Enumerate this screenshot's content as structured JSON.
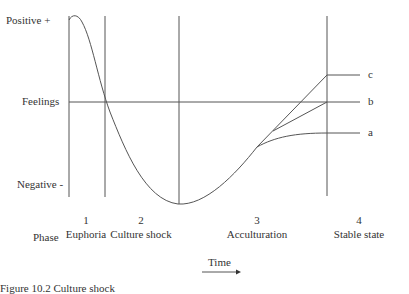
{
  "diagram": {
    "y_axis": {
      "top_label": "Positive +",
      "middle_label": "Feelings",
      "bottom_label": "Negative -"
    },
    "phase_label": "Phase",
    "phases": [
      {
        "number": "1",
        "name": "Euphoria"
      },
      {
        "number": "2",
        "name": "Culture shock"
      },
      {
        "number": "3",
        "name": "Acculturation"
      },
      {
        "number": "4",
        "name": "Stable state"
      }
    ],
    "outcomes": [
      {
        "label": "c",
        "description": "above baseline"
      },
      {
        "label": "b",
        "description": "at baseline"
      },
      {
        "label": "a",
        "description": "below baseline"
      }
    ],
    "x_axis_label": "Time",
    "caption": "Figure 10.2  Culture shock"
  },
  "colors": {
    "line": "#555555",
    "text": "#333333"
  }
}
